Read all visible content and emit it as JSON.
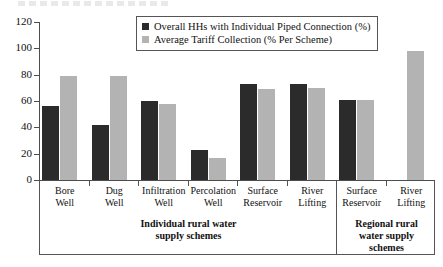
{
  "chart_data": {
    "type": "bar",
    "title": "",
    "xlabel": "",
    "ylabel": "",
    "ylim": [
      0,
      120
    ],
    "yticks": [
      0,
      20,
      40,
      60,
      80,
      100,
      120
    ],
    "grid": false,
    "legend_position": "top-center",
    "categories": [
      "Bore Well",
      "Dug Well",
      "Infiltration Well",
      "Percolation Well",
      "Surface Reservoir",
      "River Lifting",
      "Surface Reservoir",
      "River Lifting"
    ],
    "series": [
      {
        "name": "Overall HHs with Individual Piped Connection (%)",
        "color": "#2b2b2b",
        "values": [
          56,
          42,
          60,
          23,
          73,
          73,
          61,
          null
        ]
      },
      {
        "name": "Average Tariff Collection (% Per Scheme)",
        "color": "#b3b3b3",
        "values": [
          79,
          79,
          58,
          17,
          69,
          70,
          61,
          98
        ]
      }
    ],
    "group_bands": [
      {
        "label": "Individual rural water supply schemes",
        "label_lines": [
          "Individual rural water",
          "supply schemes"
        ],
        "category_indices": [
          0,
          1,
          2,
          3,
          4,
          5
        ]
      },
      {
        "label": "Regional rural water supply schemes",
        "label_lines": [
          "Regional rural",
          "water supply",
          "schemes"
        ],
        "category_indices": [
          6,
          7
        ]
      }
    ]
  },
  "axis": {
    "y_tick_labels": [
      "120",
      "100",
      "80",
      "60",
      "40",
      "20",
      "0"
    ]
  },
  "legend": {
    "entries": [
      {
        "label": "Overall HHs with Individual Piped Connection (%)",
        "swatch": "dark-square-icon"
      },
      {
        "label": "Average Tariff Collection (% Per Scheme)",
        "swatch": "light-square-icon"
      }
    ]
  },
  "category_labels": [
    {
      "lines": [
        "Bore",
        "Well"
      ]
    },
    {
      "lines": [
        "Dug",
        "Well"
      ]
    },
    {
      "lines": [
        "Infiltration",
        "Well"
      ]
    },
    {
      "lines": [
        "Percolation",
        "Well"
      ]
    },
    {
      "lines": [
        "Surface",
        "Reservoir"
      ]
    },
    {
      "lines": [
        "River",
        "Lifting"
      ]
    },
    {
      "lines": [
        "Surface",
        "Reservoir"
      ]
    },
    {
      "lines": [
        "River",
        "Lifting"
      ]
    }
  ],
  "colors": {
    "series_dark": "#2b2b2b",
    "series_light": "#b3b3b3",
    "axis": "#4d4d4d",
    "frame": "#555555",
    "background": "#ffffff",
    "text": "#111111"
  }
}
